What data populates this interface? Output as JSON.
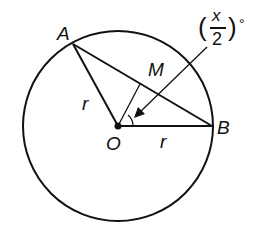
{
  "diagram": {
    "type": "circle-geometry",
    "points": {
      "A": {
        "label": "A",
        "x": 73,
        "y": 44
      },
      "B": {
        "label": "B",
        "x": 212,
        "y": 126
      },
      "O": {
        "label": "O",
        "x": 118,
        "y": 126
      },
      "M": {
        "label": "M"
      }
    },
    "segments": [
      {
        "from": "O",
        "to": "A",
        "label": "r"
      },
      {
        "from": "O",
        "to": "B",
        "label": "r"
      },
      {
        "from": "A",
        "to": "B",
        "label": ""
      },
      {
        "from": "O",
        "to": "M",
        "label": ""
      }
    ],
    "circle": {
      "center": "O",
      "radius": 95
    },
    "angle_label": {
      "paren_open": "(",
      "numerator": "x",
      "denominator": "2",
      "paren_close": ")",
      "degree": "°"
    },
    "labels": {
      "A": "A",
      "B": "B",
      "O": "O",
      "M": "M",
      "r1": "r",
      "r2": "r"
    },
    "colors": {
      "stroke": "#111111",
      "background": "#ffffff"
    }
  }
}
